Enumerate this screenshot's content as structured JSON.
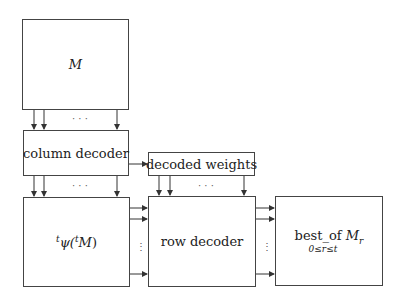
{
  "diagram": {
    "nodes": [
      {
        "id": "M",
        "label": "M"
      },
      {
        "id": "column_decoder",
        "label": "column decoder"
      },
      {
        "id": "decoded_weights",
        "label": "decoded weights"
      },
      {
        "id": "psi",
        "label_sup1": "t",
        "label_main": "ψ(",
        "label_sup2": "t",
        "label_var": "M",
        "label_close": ")"
      },
      {
        "id": "row_decoder",
        "label": "row decoder"
      },
      {
        "id": "best_of",
        "label_main": "best_of",
        "label_var": "M",
        "label_var_sub": "r",
        "label_sub": "0≤r≤t"
      }
    ],
    "edges": [
      {
        "from": "M",
        "to": "column_decoder",
        "type": "bus",
        "ellipsis": "· · ·"
      },
      {
        "from": "column_decoder",
        "to": "psi",
        "type": "bus",
        "ellipsis": "· · ·"
      },
      {
        "from": "column_decoder",
        "to": "decoded_weights",
        "type": "single"
      },
      {
        "from": "decoded_weights",
        "to": "row_decoder",
        "type": "bus",
        "ellipsis": "· · ·"
      },
      {
        "from": "psi",
        "to": "row_decoder",
        "type": "bus",
        "ellipsis": "⋮"
      },
      {
        "from": "row_decoder",
        "to": "best_of",
        "type": "bus",
        "ellipsis": "⋮"
      }
    ]
  }
}
